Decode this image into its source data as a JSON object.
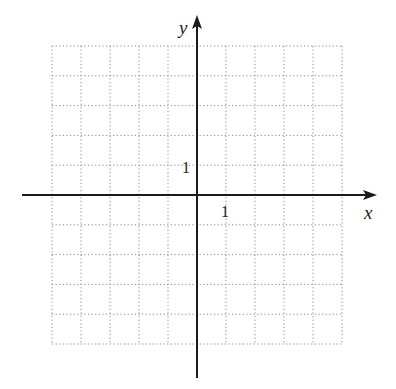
{
  "diagram": {
    "type": "coordinate-grid",
    "axes": {
      "x_label": "x",
      "y_label": "y",
      "x_tick_label": "1",
      "y_tick_label": "1"
    },
    "grid": {
      "columns": 10,
      "rows": 10,
      "x_range": [
        -5,
        5
      ],
      "y_range": [
        -5,
        5
      ],
      "line_style": "dotted",
      "line_color": "#8a8a8a"
    },
    "axis_color": "#1a1a1a"
  }
}
